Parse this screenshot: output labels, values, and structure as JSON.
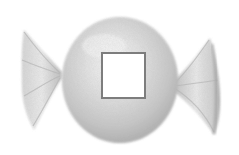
{
  "illustration": {
    "subject": "wrapped candy",
    "style": "pencil sketch, grayscale",
    "center_label": {
      "text": "",
      "shape": "square",
      "fill": "#ffffff",
      "border_color": "#7d7d7d"
    },
    "colors": {
      "background": "#ffffff",
      "shade_dark": "#9a9a9a",
      "shade_mid": "#c4c4c4",
      "shade_light": "#e6e6e6",
      "highlight": "#f8f8f8"
    }
  }
}
